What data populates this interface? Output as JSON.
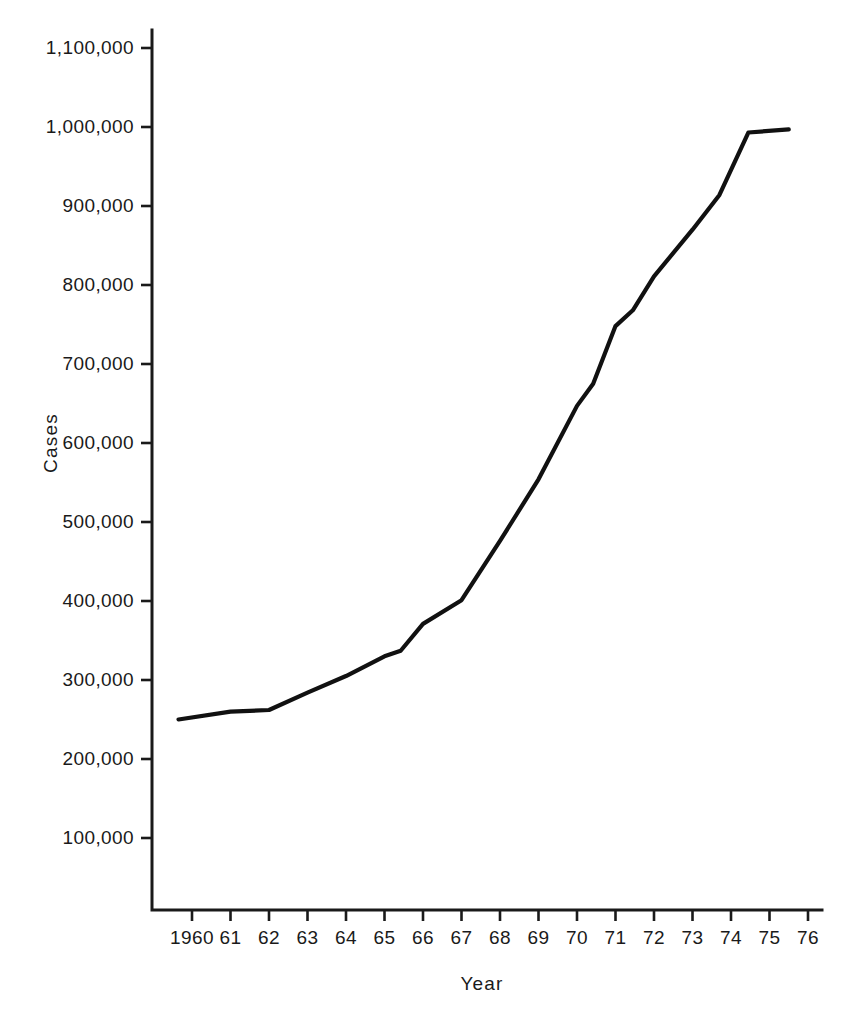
{
  "chart_data": {
    "type": "line",
    "title": "",
    "xlabel": "Year",
    "ylabel": "Cases",
    "grid": false,
    "legend": false,
    "xlim": [
      1959.5,
      1976
    ],
    "ylim": [
      0,
      1150000
    ],
    "y_ticks": [
      100000,
      200000,
      300000,
      400000,
      500000,
      600000,
      700000,
      800000,
      900000,
      1000000,
      1100000
    ],
    "y_tick_labels": [
      "100,000",
      "200,000",
      "300,000",
      "400,000",
      "500,000",
      "600,000",
      "700,000",
      "800,000",
      "900,000",
      "1,000,000",
      "1,100,000"
    ],
    "x_ticks": [
      1960,
      1961,
      1962,
      1963,
      1964,
      1965,
      1966,
      1967,
      1968,
      1969,
      1970,
      1971,
      1972,
      1973,
      1974,
      1975,
      1976
    ],
    "x_tick_labels": [
      "1960",
      "61",
      "62",
      "63",
      "64",
      "65",
      "66",
      "67",
      "68",
      "69",
      "70",
      "71",
      "72",
      "73",
      "74",
      "75",
      "76"
    ],
    "series": [
      {
        "name": "Cases",
        "color": "#111111",
        "x": [
          1959.65,
          1961.0,
          1962.0,
          1963.0,
          1964.0,
          1965.0,
          1965.42,
          1966.0,
          1967.0,
          1968.0,
          1969.0,
          1970.0,
          1970.42,
          1971.0,
          1971.45,
          1972.0,
          1973.0,
          1973.7,
          1974.45,
          1975.5
        ],
        "values": [
          250000,
          260000,
          262000,
          284000,
          305000,
          330000,
          337000,
          371000,
          401000,
          476000,
          554000,
          647000,
          675000,
          748000,
          768000,
          811000,
          870000,
          914000,
          993000,
          997000
        ]
      }
    ]
  },
  "axes": {
    "y_label": "Cases",
    "x_label": "Year"
  }
}
